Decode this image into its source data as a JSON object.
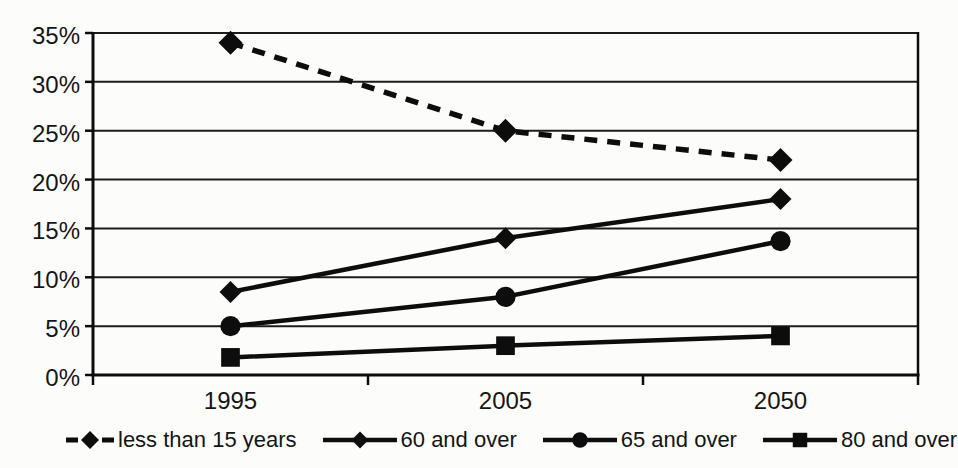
{
  "chart_data": {
    "type": "line",
    "title": "",
    "xlabel": "",
    "ylabel": "",
    "categories": [
      "1995",
      "2005",
      "2050"
    ],
    "series": [
      {
        "name": "less than 15 years",
        "marker": "diamond",
        "line_style": "dashed",
        "values": [
          34,
          25,
          22
        ]
      },
      {
        "name": "60 and over",
        "marker": "diamond",
        "line_style": "solid",
        "values": [
          8.5,
          14,
          18
        ]
      },
      {
        "name": "65 and over",
        "marker": "circle",
        "line_style": "solid",
        "values": [
          5,
          8,
          13.7
        ]
      },
      {
        "name": "80 and over",
        "marker": "square",
        "line_style": "solid",
        "values": [
          1.8,
          3,
          4
        ]
      }
    ],
    "ylim": [
      0,
      35
    ],
    "y_tick_step": 5,
    "y_tick_labels": [
      "0%",
      "5%",
      "10%",
      "15%",
      "20%",
      "25%",
      "30%",
      "35%"
    ],
    "grid": "horizontal",
    "legend_position": "bottom",
    "line_color": "#0d0d0d",
    "background_color": "#fcfcfb"
  }
}
